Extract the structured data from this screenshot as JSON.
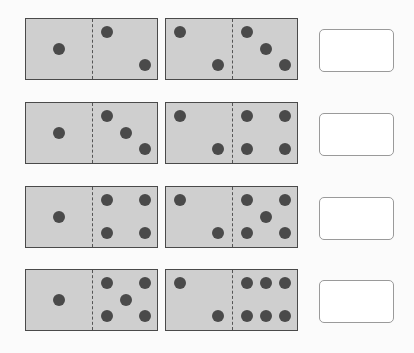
{
  "colors": {
    "domino_fill": "#cfcfcf",
    "pip": "#4a4a4a",
    "border": "#4a4a4a"
  },
  "rows": [
    {
      "dominoes": [
        {
          "left": 1,
          "right": 2
        },
        {
          "left": 2,
          "right": 3
        }
      ],
      "answer": ""
    },
    {
      "dominoes": [
        {
          "left": 1,
          "right": 3
        },
        {
          "left": 2,
          "right": 4
        }
      ],
      "answer": ""
    },
    {
      "dominoes": [
        {
          "left": 1,
          "right": 4
        },
        {
          "left": 2,
          "right": 5
        }
      ],
      "answer": ""
    },
    {
      "dominoes": [
        {
          "left": 1,
          "right": 5
        },
        {
          "left": 2,
          "right": 6
        }
      ],
      "answer": ""
    }
  ]
}
